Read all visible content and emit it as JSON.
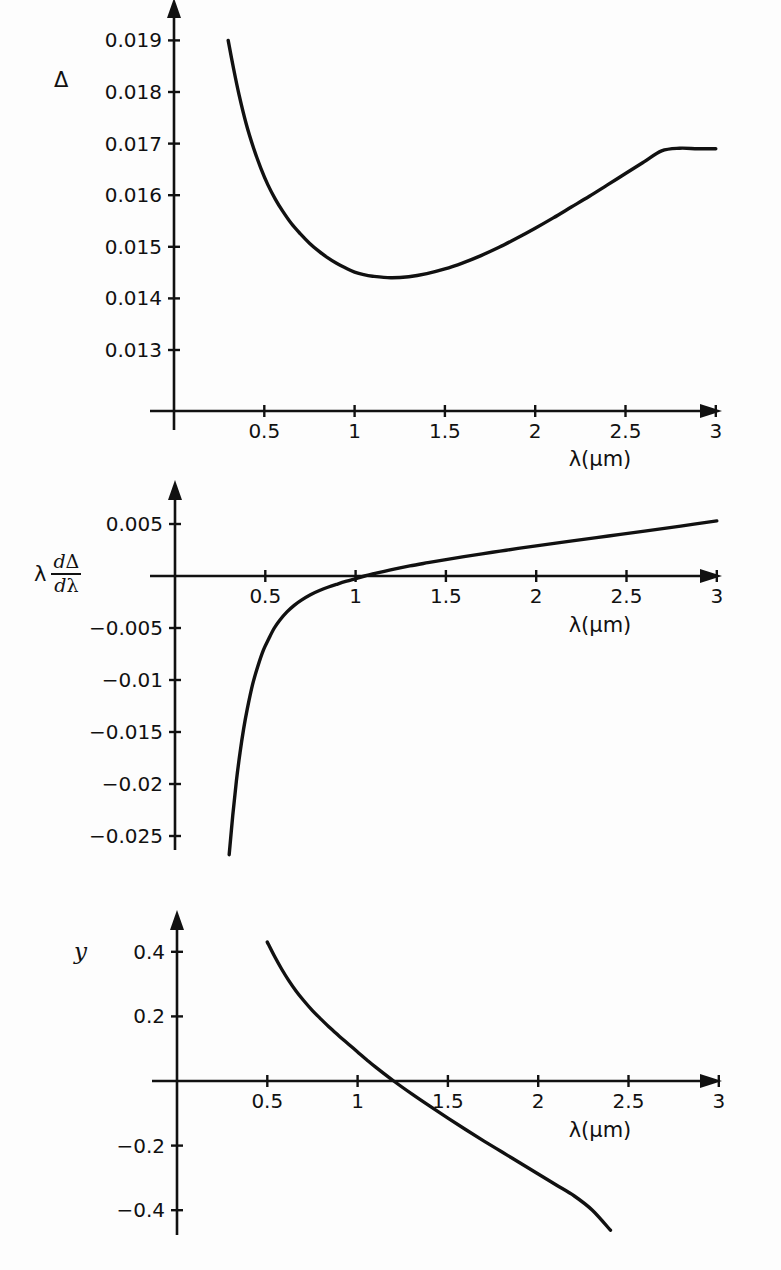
{
  "figure": {
    "background_color": "#fdfdfd",
    "ink_color": "#111111",
    "panel_count": 3
  },
  "panels": [
    {
      "id": "panel-delta",
      "ylabel": "Δ",
      "xlabel": "λ(μm)",
      "x_ticks": [
        "0.5",
        "1",
        "1.5",
        "2",
        "2.5",
        "3"
      ],
      "y_ticks": [
        "0.019",
        "0.018",
        "0.017",
        "0.016",
        "0.015",
        "0.014",
        "0.013"
      ]
    },
    {
      "id": "panel-lambda-ddelta-dlambda",
      "ylabel_lambda": "λ",
      "ylabel_num_d": "d",
      "ylabel_num_sym": "Δ",
      "ylabel_den_d": "d",
      "ylabel_den_sym": "λ",
      "xlabel": "λ(μm)",
      "x_ticks": [
        "0.5",
        "1",
        "1.5",
        "2",
        "2.5",
        "3"
      ],
      "y_ticks": [
        "0.005",
        "−0.005",
        "−0.01",
        "−0.015",
        "−0.02",
        "−0.025"
      ]
    },
    {
      "id": "panel-y",
      "ylabel": "y",
      "xlabel": "λ(μm)",
      "x_ticks": [
        "0.5",
        "1",
        "1.5",
        "2",
        "2.5",
        "3"
      ],
      "y_ticks": [
        "0.4",
        "0.2",
        "−0.2",
        "−0.4"
      ]
    }
  ],
  "chart_data": [
    {
      "type": "line",
      "title": "",
      "xlabel": "λ(μm)",
      "ylabel": "Δ",
      "xlim": [
        0,
        3.12
      ],
      "ylim": [
        0.0123,
        0.01945
      ],
      "grid": false,
      "legend": "none",
      "xticks": [
        0.5,
        1,
        1.5,
        2,
        2.5,
        3
      ],
      "xticklabels": [
        "0.5",
        "1",
        "1.5",
        "2",
        "2.5",
        "3"
      ],
      "yticks": [
        0.019,
        0.018,
        0.017,
        0.016,
        0.015,
        0.014,
        0.013
      ],
      "yticklabels": [
        "0.019",
        "0.018",
        "0.017",
        "0.016",
        "0.015",
        "0.014",
        "0.013"
      ],
      "x": [
        0.3,
        0.33,
        0.36,
        0.4,
        0.44,
        0.48,
        0.52,
        0.56,
        0.6,
        0.65,
        0.7,
        0.75,
        0.8,
        0.85,
        0.9,
        0.95,
        1.0,
        1.05,
        1.1,
        1.2,
        1.3,
        1.4,
        1.5,
        1.6,
        1.7,
        1.8,
        1.9,
        2.0,
        2.1,
        2.2,
        2.3,
        2.4,
        2.5,
        2.6,
        2.7,
        2.8,
        2.9,
        3.0
      ],
      "y": [
        0.019,
        0.01845,
        0.01795,
        0.01738,
        0.01692,
        0.01653,
        0.0162,
        0.01593,
        0.0157,
        0.01545,
        0.01525,
        0.01507,
        0.01492,
        0.01479,
        0.01468,
        0.01459,
        0.01451,
        0.01446,
        0.01443,
        0.0144,
        0.01442,
        0.01448,
        0.01457,
        0.01469,
        0.01483,
        0.01499,
        0.01517,
        0.01536,
        0.01556,
        0.01577,
        0.01598,
        0.0162,
        0.01642,
        0.01664,
        0.01686,
        0.01691,
        0.0169,
        0.0169
      ]
    },
    {
      "type": "line",
      "title": "",
      "xlabel": "λ(μm)",
      "ylabel": "λ dΔ/dλ",
      "xlim": [
        0,
        3.12
      ],
      "ylim": [
        -0.0285,
        0.0062
      ],
      "grid": false,
      "legend": "none",
      "xticks": [
        0.5,
        1,
        1.5,
        2,
        2.5,
        3
      ],
      "xticklabels": [
        "0.5",
        "1",
        "1.5",
        "2",
        "2.5",
        "3"
      ],
      "yticks": [
        0.005,
        -0.005,
        -0.01,
        -0.015,
        -0.02,
        -0.025
      ],
      "yticklabels": [
        "0.005",
        "−0.005",
        "−0.01",
        "−0.015",
        "−0.02",
        "−0.025"
      ],
      "x": [
        0.3,
        0.32,
        0.34,
        0.36,
        0.38,
        0.4,
        0.43,
        0.46,
        0.49,
        0.52,
        0.55,
        0.58,
        0.62,
        0.66,
        0.7,
        0.75,
        0.8,
        0.85,
        0.9,
        0.95,
        1.0,
        1.05,
        1.1,
        1.2,
        1.3,
        1.4,
        1.5,
        1.6,
        1.7,
        1.8,
        1.9,
        2.0,
        2.2,
        2.4,
        2.6,
        2.8,
        3.0
      ],
      "y": [
        -0.0268,
        -0.023,
        -0.0197,
        -0.017,
        -0.0147,
        -0.0128,
        -0.0104,
        -0.0086,
        -0.0071,
        -0.006,
        -0.005,
        -0.00425,
        -0.00345,
        -0.00282,
        -0.00232,
        -0.0018,
        -0.0014,
        -0.00106,
        -0.00077,
        -0.0005,
        -0.00025,
        0.0,
        0.00022,
        0.00062,
        0.00097,
        0.00128,
        0.00158,
        0.00186,
        0.00213,
        0.00239,
        0.00265,
        0.0029,
        0.00338,
        0.00385,
        0.00432,
        0.0048,
        0.0053
      ]
    },
    {
      "type": "line",
      "title": "",
      "xlabel": "λ(μm)",
      "ylabel": "y",
      "xlim": [
        0,
        3.12
      ],
      "ylim": [
        -0.5,
        0.47
      ],
      "grid": false,
      "legend": "none",
      "xticks": [
        0.5,
        1,
        1.5,
        2,
        2.5,
        3
      ],
      "xticklabels": [
        "0.5",
        "1",
        "1.5",
        "2",
        "2.5",
        "3"
      ],
      "yticks": [
        0.4,
        0.2,
        -0.2,
        -0.4
      ],
      "yticklabels": [
        "0.4",
        "0.2",
        "−0.2",
        "−0.4"
      ],
      "x": [
        0.5,
        0.54,
        0.58,
        0.62,
        0.66,
        0.7,
        0.75,
        0.8,
        0.85,
        0.9,
        0.95,
        1.0,
        1.05,
        1.1,
        1.2,
        1.3,
        1.4,
        1.5,
        1.6,
        1.7,
        1.8,
        1.9,
        2.0,
        2.1,
        2.2,
        2.3,
        2.4
      ],
      "y": [
        0.43,
        0.386,
        0.346,
        0.31,
        0.278,
        0.25,
        0.218,
        0.19,
        0.163,
        0.138,
        0.114,
        0.09,
        0.066,
        0.043,
        0.0,
        -0.04,
        -0.078,
        -0.115,
        -0.151,
        -0.186,
        -0.22,
        -0.254,
        -0.288,
        -0.322,
        -0.356,
        -0.4,
        -0.462
      ]
    }
  ]
}
